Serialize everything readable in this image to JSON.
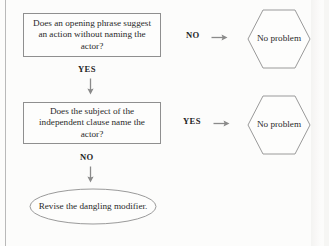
{
  "diagram": {
    "stroke_color": "#8f8f8f",
    "text_color": "#2a2a2a",
    "background_color": "#fcfcfb",
    "nodes": {
      "question_1": "Does an opening phrase suggest an action without naming the actor?",
      "question_2": "Does the subject of the independent clause name the actor?",
      "outcome_1": "No problem",
      "outcome_2": "No problem",
      "terminal": "Revise the dangling modifier."
    },
    "branches": {
      "q1_no": "NO",
      "q1_yes": "YES",
      "q2_yes": "YES",
      "q2_no": "NO"
    },
    "icons": {
      "arrow_down": "arrow-down-icon",
      "arrow_right": "arrow-right-icon"
    }
  }
}
